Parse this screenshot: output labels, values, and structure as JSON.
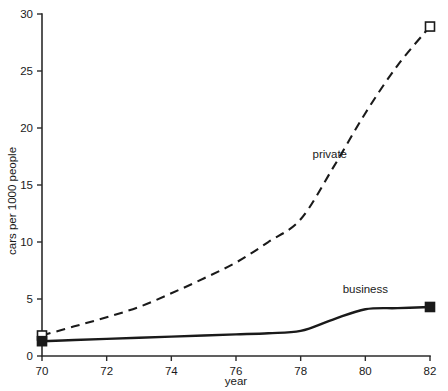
{
  "chart_data": {
    "type": "line",
    "title": "",
    "xlabel": "year",
    "ylabel": "cars per 1000 people",
    "xlim": [
      70,
      82
    ],
    "ylim": [
      0,
      30
    ],
    "xticks": [
      70,
      72,
      74,
      76,
      78,
      80,
      82
    ],
    "xtick_labels": [
      "70",
      "72",
      "74",
      "76",
      "78",
      "80",
      "82"
    ],
    "yticks": [
      0,
      5,
      10,
      15,
      20,
      25,
      30
    ],
    "ytick_labels": [
      "0",
      "5",
      "10",
      "15",
      "20",
      "25",
      "30"
    ],
    "grid": false,
    "legend_position": "inline-annotation",
    "x": [
      70,
      71,
      72,
      73,
      74,
      75,
      76,
      77,
      78,
      79,
      80,
      81,
      82
    ],
    "series": [
      {
        "name": "private",
        "label": "private",
        "style": "dashed",
        "marker": "open-square",
        "marker_points": [
          70,
          82
        ],
        "values": [
          1.8,
          2.6,
          3.4,
          4.3,
          5.5,
          6.8,
          8.2,
          10.0,
          12.0,
          16.5,
          21.3,
          25.5,
          28.9
        ]
      },
      {
        "name": "business",
        "label": "business",
        "style": "solid",
        "marker": "filled-square",
        "marker_points": [
          70,
          82
        ],
        "values": [
          1.3,
          1.4,
          1.5,
          1.6,
          1.7,
          1.8,
          1.9,
          2.0,
          2.2,
          3.2,
          4.1,
          4.2,
          4.3
        ]
      }
    ],
    "annotations": [
      {
        "text": "private",
        "x": 78.9,
        "y": 17.4
      },
      {
        "text": "business",
        "x": 80.0,
        "y": 5.5
      }
    ]
  },
  "axes_geometry": {
    "plot_left_px": 42,
    "plot_right_px": 430,
    "plot_top_px": 14,
    "plot_bottom_px": 356
  },
  "colors": {
    "ink": "#1a1a1a",
    "axis": "#2b2b2b",
    "background": "#ffffff"
  }
}
